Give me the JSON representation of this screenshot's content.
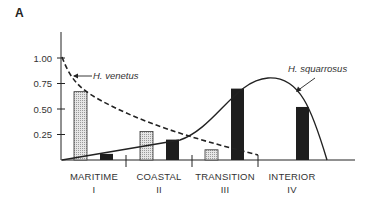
{
  "panel_label": "A",
  "chart_data": {
    "type": "bar",
    "title": "",
    "xlabel": "",
    "ylabel": "",
    "ylim": [
      0,
      1.2
    ],
    "yticks": [
      "0.25",
      "0.50",
      "0.75",
      "1.00"
    ],
    "ytick_values": [
      0.25,
      0.5,
      0.75,
      1.0
    ],
    "grid": false,
    "categories": [
      {
        "name": "MARITIME",
        "numeral": "I"
      },
      {
        "name": "COASTAL",
        "numeral": "II"
      },
      {
        "name": "TRANSITION",
        "numeral": "III"
      },
      {
        "name": "INTERIOR",
        "numeral": "IV"
      }
    ],
    "series": [
      {
        "name": "H. venetus",
        "bar_style": "stippled-light",
        "values": [
          0.67,
          0.28,
          0.1,
          null
        ],
        "curve_style": "dashed"
      },
      {
        "name": "H. squarrosus",
        "bar_style": "solid-dark",
        "values": [
          0.06,
          0.2,
          0.7,
          0.52
        ],
        "curve_style": "solid"
      }
    ],
    "annotations": [
      {
        "text": "H. venetus",
        "points_to": "dashed curve near 0.80 in MARITIME"
      },
      {
        "text": "H. squarrosus",
        "points_to": "solid curve descending in INTERIOR"
      }
    ]
  }
}
